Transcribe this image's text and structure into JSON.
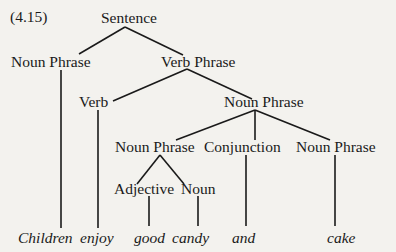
{
  "figure": {
    "number": "(4.15)",
    "nodes": {
      "sentence": "Sentence",
      "np_subject": "Noun Phrase",
      "verb_phrase": "Verb Phrase",
      "verb": "Verb",
      "np_object": "Noun Phrase",
      "np_left": "Noun Phrase",
      "conjunction": "Conjunction",
      "np_right": "Noun Phrase",
      "adjective": "Adjective",
      "noun": "Noun"
    },
    "words": [
      "Children",
      "enjoy",
      "good",
      "candy",
      "and",
      "cake"
    ]
  }
}
